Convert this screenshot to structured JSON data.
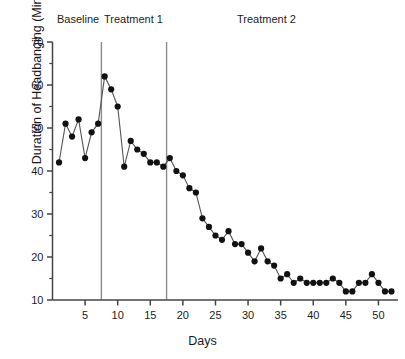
{
  "chart_data": {
    "type": "line",
    "title": "",
    "xlabel": "Days",
    "ylabel": "Duration of Headbanging (Minutes)",
    "xlim": [
      0,
      53
    ],
    "ylim": [
      10,
      70
    ],
    "xticks": [
      5,
      10,
      15,
      20,
      25,
      30,
      35,
      40,
      45,
      50
    ],
    "yticks": [
      10,
      20,
      30,
      40,
      50,
      60,
      70
    ],
    "minor_yticks": [
      15,
      25,
      35,
      45,
      55,
      65
    ],
    "grid": false,
    "legend_position": "none",
    "marker": "filled-circle",
    "marker_color": "#111111",
    "line_color": "#555555",
    "x": [
      1,
      2,
      3,
      4,
      5,
      6,
      7,
      8,
      9,
      10,
      11,
      12,
      13,
      14,
      15,
      16,
      17,
      18,
      19,
      20,
      21,
      22,
      23,
      24,
      25,
      26,
      27,
      28,
      29,
      30,
      31,
      32,
      33,
      34,
      35,
      36,
      37,
      38,
      39,
      40,
      41,
      42,
      43,
      44,
      45,
      46,
      47,
      48,
      49,
      50,
      51,
      52
    ],
    "values": [
      42,
      51,
      48,
      52,
      43,
      49,
      51,
      62,
      59,
      55,
      41,
      47,
      45,
      44,
      42,
      42,
      41,
      43,
      40,
      39,
      36,
      35,
      29,
      27,
      25,
      24,
      26,
      23,
      23,
      21,
      19,
      22,
      19,
      18,
      15,
      16,
      14,
      15,
      14,
      14,
      14,
      14,
      15,
      14,
      12,
      12,
      14,
      14,
      16,
      14,
      12,
      12
    ],
    "annotations": [
      {
        "label": "Baseline",
        "x_range": [
          0,
          7.5
        ]
      },
      {
        "label": "Treatment 1",
        "x_range": [
          7.5,
          17.5
        ]
      },
      {
        "label": "Treatment 2",
        "x_range": [
          17.5,
          53
        ]
      }
    ],
    "phase_dividers": [
      7.5,
      17.5
    ]
  },
  "labels": {
    "baseline": "Baseline",
    "treatment1": "Treatment 1",
    "treatment2": "Treatment 2",
    "x_title": "Days",
    "y_title": "Duration of Headbanging (Minutes)"
  },
  "colors": {
    "marker": "#111111",
    "line": "#555555",
    "axis": "#444444",
    "divider": "#8c8c8c",
    "text": "#1a1a1a",
    "background": "#ffffff"
  }
}
